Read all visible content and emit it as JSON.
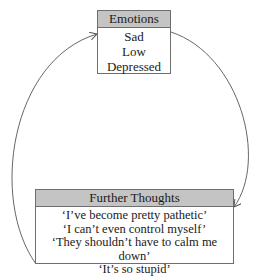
{
  "diagram": {
    "type": "cycle",
    "nodes": [
      {
        "id": "emotions",
        "title": "Emotions",
        "lines": [
          "Sad",
          "Low",
          "Depressed"
        ]
      },
      {
        "id": "further_thoughts",
        "title": "Further Thoughts",
        "lines": [
          "‘I’ve become pretty pathetic’",
          "‘I can’t even control myself’",
          "‘They shouldn’t have to calm me down’",
          "‘It’s so stupid’"
        ]
      }
    ],
    "edges": [
      {
        "from": "emotions",
        "to": "further_thoughts",
        "side": "right"
      },
      {
        "from": "further_thoughts",
        "to": "emotions",
        "side": "left"
      }
    ],
    "colors": {
      "header_fill": "#c4c4c4",
      "border": "#6e6e6e",
      "arrow": "#555555"
    }
  }
}
